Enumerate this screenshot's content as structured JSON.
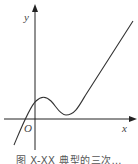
{
  "figure": {
    "axis_labels": {
      "x": "x",
      "y": "y",
      "origin": "O"
    },
    "caption": "图 X-XX  典型的三次…"
  },
  "colors": {
    "axis": "#222222",
    "curve": "#333333",
    "label": "#444444"
  }
}
